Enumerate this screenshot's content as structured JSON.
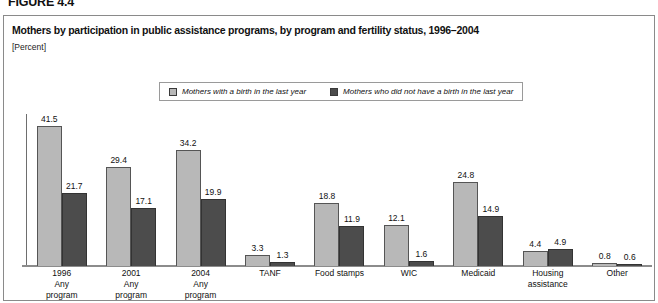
{
  "figure": {
    "number": "FIGURE 4.4"
  },
  "header": {
    "title": "Mothers by participation in public assistance programs, by program and fertility status, 1996–2004",
    "subtitle": "[Percent]"
  },
  "legend": {
    "entries": [
      {
        "label": "Mothers with a birth in the last year",
        "swatch": "light-gray-square-icon",
        "color": "#b8b8b8"
      },
      {
        "label": "Mothers who did not have a birth in the last year",
        "swatch": "dark-gray-square-icon",
        "color": "#4c4c4c"
      }
    ]
  },
  "bracket": {
    "label": "2004"
  },
  "chart_data": {
    "type": "bar",
    "title": "Mothers by participation in public assistance programs, by program and fertility status, 1996–2004",
    "subtitle": "[Percent]",
    "xlabel": "",
    "ylabel": "Percent",
    "ylim": [
      0,
      45
    ],
    "grid": false,
    "legend_position": "top-center",
    "categories": [
      "1996 Any program",
      "2001 Any program",
      "2004 Any program",
      "TANF",
      "Food stamps",
      "WIC",
      "Medicaid",
      "Housing assistance",
      "Other"
    ],
    "category_lines": [
      [
        "1996",
        "Any",
        "program"
      ],
      [
        "2001",
        "Any",
        "program"
      ],
      [
        "2004",
        "Any",
        "program"
      ],
      [
        "TANF"
      ],
      [
        "Food stamps"
      ],
      [
        "WIC"
      ],
      [
        "Medicaid"
      ],
      [
        "Housing",
        "assistance"
      ],
      [
        "Other"
      ]
    ],
    "series": [
      {
        "name": "Mothers with a birth in the last year",
        "color": "#b8b8b8",
        "values": [
          41.5,
          29.4,
          34.2,
          3.3,
          18.8,
          12.1,
          24.8,
          4.4,
          0.8
        ]
      },
      {
        "name": "Mothers who did not have a birth in the last year",
        "color": "#4c4c4c",
        "values": [
          21.7,
          17.1,
          19.9,
          1.3,
          11.9,
          1.6,
          14.9,
          4.9,
          0.6
        ]
      }
    ],
    "annotations": [
      {
        "text": "2004",
        "note": "bracket spanning TANF through Other"
      }
    ]
  }
}
